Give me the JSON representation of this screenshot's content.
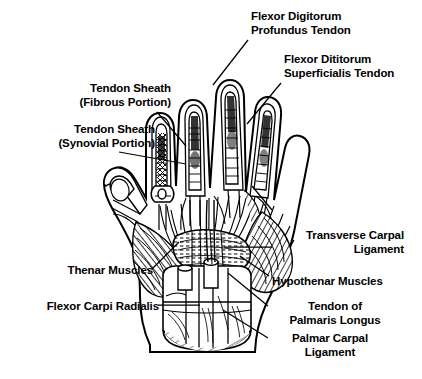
{
  "figure": {
    "background_color": "#ffffff",
    "ink_color": "#000000",
    "width": 422,
    "height": 379
  },
  "labels": [
    {
      "id": "flexor-digitorum-profundus-tendon",
      "lines": [
        "Flexor Digitorum",
        "Profundus Tendon"
      ],
      "align": "left",
      "x": 251,
      "y": 10,
      "leader": [
        [
          248,
          40
        ],
        [
          213,
          85
        ]
      ]
    },
    {
      "id": "flexor-digitorum-superficialis-tendon",
      "lines": [
        "Flexor Dititorum",
        "Superficialis Tendon"
      ],
      "align": "left",
      "x": 284,
      "y": 53,
      "leader": [
        [
          281,
          83
        ],
        [
          247,
          124
        ]
      ]
    },
    {
      "id": "tendon-sheath-fibrous-portion",
      "lines": [
        "Tendon Sheath",
        "(Fibrous Portion)",
        ""
      ],
      "align": "right",
      "x": 56,
      "y": 82,
      "leader": [
        [
          157,
          112
        ],
        [
          186,
          146
        ]
      ]
    },
    {
      "id": "tendon-sheath-synovial-portion",
      "lines": [
        "Tendon Sheath",
        "(Synovial Portion)"
      ],
      "align": "right",
      "x": 15,
      "y": 123,
      "leader": [
        [
          119,
          152
        ],
        [
          186,
          164
        ]
      ]
    },
    {
      "id": "fourth-lumbrical-muscle",
      "lines": [
        "4th Lumbrical Muscle"
      ],
      "align": "left",
      "x": 276,
      "y": 204,
      "leader": [
        [
          272,
          210
        ],
        [
          252,
          186
        ]
      ]
    },
    {
      "id": "transverse-carpal-ligament",
      "lines": [
        "Transverse Carpal",
        "Ligament"
      ],
      "align": "right",
      "x": 274,
      "y": 229,
      "leader": [
        [
          272,
          247
        ],
        [
          224,
          247
        ]
      ]
    },
    {
      "id": "thenar-muscles",
      "lines": [
        "Thenar Muscles"
      ],
      "align": "right",
      "x": 48,
      "y": 264,
      "leader": [
        [
          152,
          269
        ],
        [
          179,
          242
        ]
      ]
    },
    {
      "id": "hypothenar-muscles",
      "lines": [
        "Hypothenar Muscles"
      ],
      "align": "left",
      "x": 272,
      "y": 275,
      "leader": [
        [
          269,
          276
        ],
        [
          240,
          256
        ]
      ]
    },
    {
      "id": "flexor-carpi-radialis",
      "lines": [
        "Flexor Carpi Radialis"
      ],
      "align": "right",
      "x": 29,
      "y": 300,
      "leader": [
        [
          158,
          305
        ],
        [
          200,
          305
        ]
      ]
    },
    {
      "id": "tendon-of-palmaris-longus",
      "lines": [
        "Tendon of",
        "Palmaris Longus"
      ],
      "align": "center",
      "x": 270,
      "y": 300,
      "leader": [
        [
          268,
          306
        ],
        [
          228,
          273
        ]
      ]
    },
    {
      "id": "palmar-carpal-ligament",
      "lines": [
        "Palmar Carpal",
        "Ligament"
      ],
      "align": "center",
      "x": 270,
      "y": 332,
      "leader": [
        [
          268,
          338
        ],
        [
          223,
          310
        ]
      ]
    }
  ]
}
